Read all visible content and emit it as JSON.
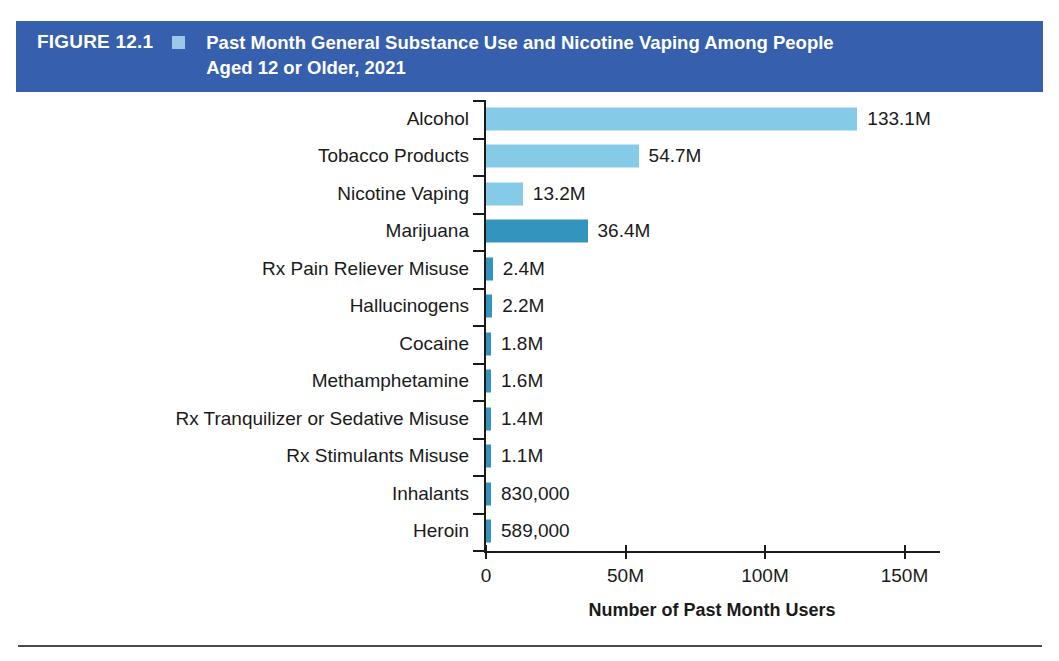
{
  "banner": {
    "figure_number": "FIGURE 12.1",
    "marker_icon": "square-marker-icon",
    "title_line1": "Past Month General Substance Use and Nicotine Vaping Among People",
    "title_line2": "Aged 12 or Older, 2021",
    "background_color": "#3660ad",
    "marker_color": "#9ec6e8",
    "text_color": "#ffffff"
  },
  "chart_data": {
    "type": "bar",
    "orientation": "horizontal",
    "title": "Past Month General Substance Use and Nicotine Vaping Among People Aged 12 or Older, 2021",
    "xlabel": "Number of Past Month Users",
    "ylabel": "",
    "xlim": [
      0,
      160
    ],
    "xticks": [
      0,
      50,
      100,
      150
    ],
    "xtick_labels": [
      "0",
      "50M",
      "100M",
      "150M"
    ],
    "grid": false,
    "legend": false,
    "unit": "millions of people",
    "categories": [
      "Alcohol",
      "Tobacco Products",
      "Nicotine Vaping",
      "Marijuana",
      "Rx Pain Reliever Misuse",
      "Hallucinogens",
      "Cocaine",
      "Methamphetamine",
      "Rx Tranquilizer or Sedative Misuse",
      "Rx Stimulants Misuse",
      "Inhalants",
      "Heroin"
    ],
    "values": [
      133.1,
      54.7,
      13.2,
      36.4,
      2.4,
      2.2,
      1.8,
      1.6,
      1.4,
      1.1,
      0.83,
      0.589
    ],
    "value_labels": [
      "133.1M",
      "54.7M",
      "13.2M",
      "36.4M",
      "2.4M",
      "2.2M",
      "1.8M",
      "1.6M",
      "1.4M",
      "1.1M",
      "830,000",
      "589,000"
    ],
    "bar_colors": [
      "#85cbe8",
      "#85cbe8",
      "#85cbe8",
      "#3395be",
      "#3395be",
      "#3395be",
      "#3395be",
      "#3395be",
      "#3395be",
      "#3395be",
      "#3395be",
      "#3395be"
    ],
    "colors": {
      "light_blue": "#85cbe8",
      "teal_blue": "#3395be",
      "axis": "#1a1a1a"
    }
  }
}
